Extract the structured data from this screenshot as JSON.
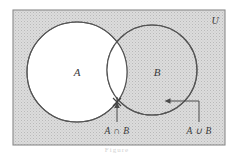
{
  "figure": {
    "kind": "venn-diagram",
    "caption": "Figure",
    "universe": {
      "label": "U",
      "fill": "#d9d9d9",
      "border": "#7a7a7a"
    },
    "sets": [
      {
        "id": "A",
        "label": "A",
        "fill": "#ffffff",
        "border": "#555555"
      },
      {
        "id": "B",
        "label": "B",
        "fill": "none",
        "border": "#555555"
      }
    ],
    "regions": {
      "intersection_label": "A ∩ B",
      "union_label": "A ∪ B"
    },
    "annotations": [
      {
        "name": "intersection-callout",
        "text": "A ∩ B",
        "target": "lower crossing point of circles"
      },
      {
        "name": "union-callout",
        "text": "A ∪ B",
        "target": "interior of circle B"
      }
    ],
    "colors": {
      "stipple": "#c9c9c9",
      "background": "#d9d9d9",
      "ink": "#4a4a4a"
    }
  }
}
